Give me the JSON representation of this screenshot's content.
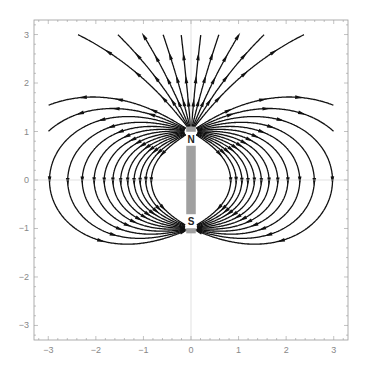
{
  "chart_data": {
    "type": "streamplot",
    "title": "",
    "xlabel": "",
    "ylabel": "",
    "xlim": [
      -3.3,
      3.3
    ],
    "ylim": [
      -3.3,
      3.3
    ],
    "xticks": [
      -3,
      -2,
      -1,
      0,
      1,
      2,
      3
    ],
    "yticks": [
      -3,
      -2,
      -1,
      0,
      1,
      2,
      3
    ],
    "grid": false,
    "axes_lines_at_zero": true,
    "magnet": {
      "x_range": [
        -0.1,
        0.1
      ],
      "y_range": [
        -1.1,
        1.1
      ],
      "north_label": "N",
      "south_label": "S",
      "north_pos": [
        0,
        0.85
      ],
      "south_pos": [
        0,
        -0.85
      ],
      "color": "#a0a0a0"
    },
    "field_direction": "out of N (top), into S (bottom)",
    "stream_color": "#000000"
  }
}
